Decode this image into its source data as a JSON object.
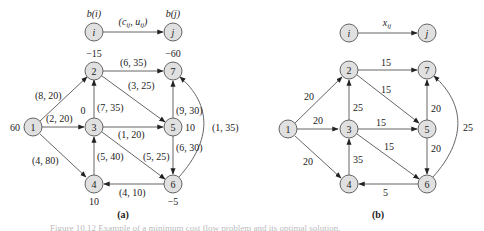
{
  "diagrams": [
    {
      "id": "a",
      "caption": "(a)",
      "legend": {
        "from_node": "i",
        "to_node": "j",
        "from_supply": "b(i)",
        "to_supply": "b(j)",
        "edge_label": "(c_ij, u_ij)"
      },
      "nodes": [
        {
          "id": "1",
          "supply": "60"
        },
        {
          "id": "2",
          "supply": "−15"
        },
        {
          "id": "3",
          "supply": "0"
        },
        {
          "id": "4",
          "supply": "10"
        },
        {
          "id": "5",
          "supply": "10"
        },
        {
          "id": "6",
          "supply": "−5"
        },
        {
          "id": "7",
          "supply": "−60"
        }
      ],
      "edges": [
        {
          "from": "1",
          "to": "2",
          "label": "(8, 20)"
        },
        {
          "from": "1",
          "to": "3",
          "label": "(2, 20)"
        },
        {
          "from": "1",
          "to": "4",
          "label": "(4, 80)"
        },
        {
          "from": "3",
          "to": "2",
          "label": "(7, 35)"
        },
        {
          "from": "2",
          "to": "7",
          "label": "(6, 35)"
        },
        {
          "from": "2",
          "to": "5",
          "label": "(3, 25)"
        },
        {
          "from": "3",
          "to": "5",
          "label": "(1, 20)"
        },
        {
          "from": "3",
          "to": "6",
          "label": "(5, 25)"
        },
        {
          "from": "4",
          "to": "3",
          "label": "(5, 40)"
        },
        {
          "from": "5",
          "to": "7",
          "label": "(9, 30)"
        },
        {
          "from": "5",
          "to": "6",
          "label": "(6, 30)"
        },
        {
          "from": "6",
          "to": "4",
          "label": "(4, 10)"
        },
        {
          "from": "6",
          "to": "7",
          "label": "(1, 35)"
        }
      ]
    },
    {
      "id": "b",
      "caption": "(b)",
      "legend": {
        "from_node": "i",
        "to_node": "j",
        "edge_label": "x_ij"
      },
      "nodes": [
        {
          "id": "1"
        },
        {
          "id": "2"
        },
        {
          "id": "3"
        },
        {
          "id": "4"
        },
        {
          "id": "5"
        },
        {
          "id": "6"
        },
        {
          "id": "7"
        }
      ],
      "edges": [
        {
          "from": "1",
          "to": "2",
          "label": "20"
        },
        {
          "from": "1",
          "to": "3",
          "label": "20"
        },
        {
          "from": "1",
          "to": "4",
          "label": "20"
        },
        {
          "from": "3",
          "to": "2",
          "label": "25"
        },
        {
          "from": "2",
          "to": "7",
          "label": "15"
        },
        {
          "from": "2",
          "to": "5",
          "label": "15"
        },
        {
          "from": "3",
          "to": "5",
          "label": "15"
        },
        {
          "from": "3",
          "to": "6",
          "label": "15"
        },
        {
          "from": "4",
          "to": "3",
          "label": "35"
        },
        {
          "from": "5",
          "to": "7",
          "label": "20"
        },
        {
          "from": "5",
          "to": "6",
          "label": "20"
        },
        {
          "from": "6",
          "to": "4",
          "label": "5"
        },
        {
          "from": "6",
          "to": "7",
          "label": "25"
        }
      ]
    }
  ],
  "figure_caption": "Figure 10.12  Example of a minimum cost flow problem and its optimal solution."
}
